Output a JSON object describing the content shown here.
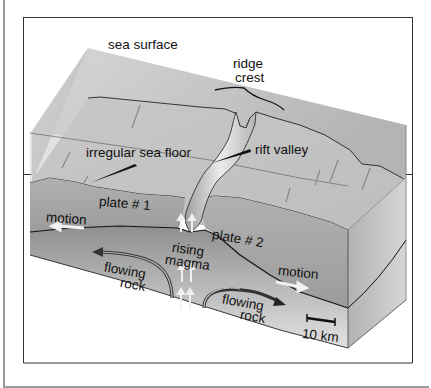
{
  "figure": {
    "labels": {
      "sea_surface": "sea surface",
      "ridge_crest_line1": "ridge",
      "ridge_crest_line2": "crest",
      "irregular_sea_floor": "irregular sea floor",
      "rift_valley": "rift valley",
      "plate_1": "plate # 1",
      "plate_2": "plate # 2",
      "motion_left": "motion",
      "motion_right": "motion",
      "rising_magma_line1": "rising",
      "rising_magma_line2": "magma",
      "flowing_rock_left_line1": "flowing",
      "flowing_rock_left_line2": "rock",
      "flowing_rock_right_line1": "flowing",
      "flowing_rock_right_line2": "rock",
      "scale_bar": "10 km"
    },
    "colors": {
      "water": "#c9c9c9",
      "sea_floor": "#b8b8b8",
      "plate": "#a6a6a6",
      "mantle": "#9a9a9a",
      "outline": "#111111"
    }
  }
}
